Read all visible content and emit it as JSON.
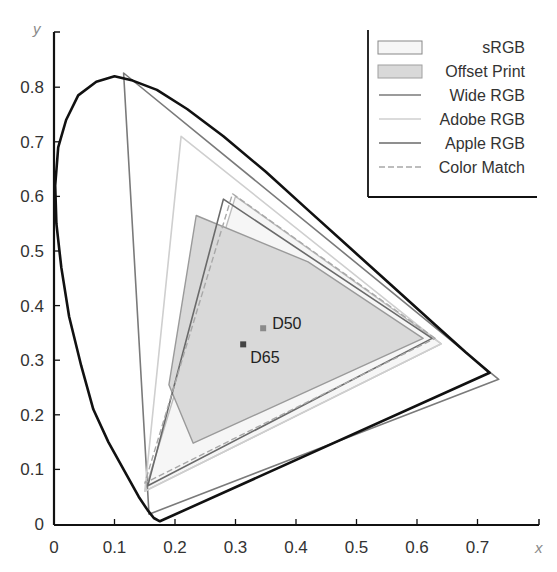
{
  "chart_data": {
    "type": "line",
    "title": "",
    "xlabel": "x",
    "ylabel": "y",
    "xlim": [
      0,
      0.8
    ],
    "ylim": [
      0,
      0.85
    ],
    "grid": false,
    "legend_position": "top-right",
    "x_ticks": [
      "0",
      "0.1",
      "0.2",
      "0.3",
      "0.4",
      "0.5",
      "0.6",
      "0.7"
    ],
    "y_ticks": [
      "0",
      "0.1",
      "0.2",
      "0.3",
      "0.4",
      "0.5",
      "0.6",
      "0.7",
      "0.8"
    ],
    "spectral_locus": [
      [
        0.175,
        0.005
      ],
      [
        0.165,
        0.011
      ],
      [
        0.155,
        0.025
      ],
      [
        0.14,
        0.05
      ],
      [
        0.12,
        0.09
      ],
      [
        0.09,
        0.15
      ],
      [
        0.065,
        0.21
      ],
      [
        0.045,
        0.29
      ],
      [
        0.025,
        0.38
      ],
      [
        0.012,
        0.47
      ],
      [
        0.004,
        0.55
      ],
      [
        0.002,
        0.62
      ],
      [
        0.007,
        0.69
      ],
      [
        0.02,
        0.74
      ],
      [
        0.04,
        0.785
      ],
      [
        0.07,
        0.81
      ],
      [
        0.1,
        0.82
      ],
      [
        0.13,
        0.812
      ],
      [
        0.17,
        0.795
      ],
      [
        0.22,
        0.76
      ],
      [
        0.28,
        0.71
      ],
      [
        0.35,
        0.645
      ],
      [
        0.42,
        0.575
      ],
      [
        0.49,
        0.505
      ],
      [
        0.56,
        0.435
      ],
      [
        0.63,
        0.365
      ],
      [
        0.68,
        0.315
      ],
      [
        0.72,
        0.277
      ]
    ],
    "series": [
      {
        "name": "sRGB",
        "style": "filled-outline",
        "fill": "#f6f6f6",
        "stroke": "#bdbdbd",
        "points": [
          [
            0.64,
            0.33
          ],
          [
            0.3,
            0.6
          ],
          [
            0.15,
            0.06
          ]
        ]
      },
      {
        "name": "Offset Print",
        "style": "filled",
        "fill": "#d9d9d9",
        "stroke": "#9a9a9a",
        "points": [
          [
            0.235,
            0.565
          ],
          [
            0.42,
            0.48
          ],
          [
            0.61,
            0.34
          ],
          [
            0.23,
            0.148
          ],
          [
            0.19,
            0.255
          ]
        ]
      },
      {
        "name": "Wide RGB",
        "style": "line",
        "stroke": "#7a7a7a",
        "points": [
          [
            0.735,
            0.265
          ],
          [
            0.115,
            0.826
          ],
          [
            0.157,
            0.018
          ]
        ]
      },
      {
        "name": "Adobe RGB",
        "style": "line",
        "stroke": "#cfcfcf",
        "points": [
          [
            0.64,
            0.33
          ],
          [
            0.21,
            0.71
          ],
          [
            0.15,
            0.06
          ]
        ]
      },
      {
        "name": "Apple RGB",
        "style": "line",
        "stroke": "#6a6a6a",
        "points": [
          [
            0.625,
            0.34
          ],
          [
            0.28,
            0.595
          ],
          [
            0.155,
            0.07
          ]
        ]
      },
      {
        "name": "Color Match",
        "style": "dashed",
        "stroke": "#a8a8a8",
        "points": [
          [
            0.63,
            0.34
          ],
          [
            0.295,
            0.605
          ],
          [
            0.15,
            0.075
          ]
        ]
      }
    ],
    "annotations": [
      {
        "label": "D50",
        "x": 0.3457,
        "y": 0.3585,
        "color": "#8a8a8a"
      },
      {
        "label": "D65",
        "x": 0.3127,
        "y": 0.329,
        "color": "#444444"
      }
    ]
  },
  "legend": {
    "items": [
      {
        "label": "sRGB"
      },
      {
        "label": "Offset Print"
      },
      {
        "label": "Wide RGB"
      },
      {
        "label": "Adobe RGB"
      },
      {
        "label": "Apple RGB"
      },
      {
        "label": "Color Match"
      }
    ]
  }
}
